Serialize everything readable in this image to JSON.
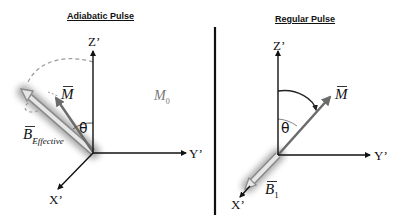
{
  "left_panel": {
    "title": "Adiabatic Pulse",
    "axes": {
      "z": "Z’",
      "y": "Y’",
      "x": "X’"
    },
    "vectors": {
      "magnetization": "M",
      "field_main": "B",
      "field_subscript": "Effective"
    },
    "angle": "θ",
    "equilibrium_label": "M",
    "equilibrium_subscript": "0"
  },
  "right_panel": {
    "title": "Regular Pulse",
    "axes": {
      "z": "Z’",
      "y": "Y’",
      "x": "X’"
    },
    "vectors": {
      "magnetization": "M",
      "field_main": "B",
      "field_subscript": "1"
    },
    "angle": "θ"
  },
  "colors": {
    "axis": "#111111",
    "vector_gray": "#6b6b6b",
    "field_fill": "#d9d9d9",
    "field_glow": "#9a9a9a",
    "dashed_arc": "#9a9a9a",
    "divider": "#111111"
  }
}
